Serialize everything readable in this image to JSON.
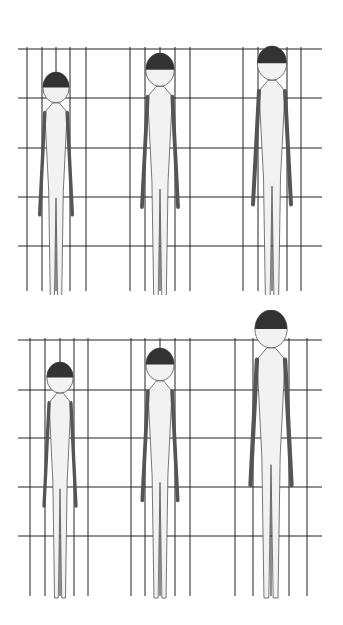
{
  "diagram": {
    "colors": {
      "grid": "#222222",
      "figure_fill": "#f2f2f2",
      "figure_stroke": "#555555",
      "hair": "#333333"
    },
    "panels": [
      {
        "id": "top",
        "top": 20,
        "height": 275,
        "h_lines": [
          29,
          78,
          128,
          177,
          226
        ],
        "v_lines": [
          27,
          42,
          56,
          70,
          86,
          130,
          145,
          160,
          175,
          190,
          243,
          258,
          272,
          287,
          301
        ],
        "figures": [
          {
            "cx": 56,
            "head_top": 52,
            "feet": 290,
            "scale": 0.86
          },
          {
            "cx": 160,
            "head_top": 33,
            "feet": 290,
            "scale": 0.95
          },
          {
            "cx": 272,
            "head_top": 26,
            "feet": 290,
            "scale": 1.0
          }
        ]
      },
      {
        "id": "bottom",
        "top": 310,
        "height": 290,
        "h_lines": [
          30,
          80,
          128,
          177,
          226
        ],
        "v_lines": [
          30,
          45,
          60,
          74,
          88,
          131,
          145,
          160,
          175,
          190,
          235,
          253,
          271,
          289,
          307
        ],
        "figures": [
          {
            "cx": 60,
            "head_top": 52,
            "feet": 292,
            "scale": 0.84
          },
          {
            "cx": 160,
            "head_top": 38,
            "feet": 292,
            "scale": 0.93
          },
          {
            "cx": 271,
            "head_top": 0,
            "feet": 292,
            "scale": 1.08
          }
        ]
      }
    ]
  }
}
